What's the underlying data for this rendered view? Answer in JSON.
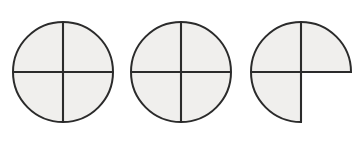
{
  "figure": {
    "background_color": "#ffffff",
    "fill_color": "#f0efed",
    "line_color": "#2b2b2b",
    "line_width": 2,
    "canvas": {
      "width": 362,
      "height": 141
    }
  },
  "chart_data": {
    "type": "pie",
    "xlabel": "",
    "ylabel": "",
    "legend": [],
    "grid": false,
    "shapes": [
      {
        "name": "circle-one",
        "label": "4/4",
        "center_x": 63,
        "center_y": 72,
        "radius": 51,
        "total_parts": 4,
        "shaded_parts": 4,
        "fraction_value": 1,
        "quadrants_shaded": [
          "top-left",
          "top-right",
          "bottom-left",
          "bottom-right"
        ]
      },
      {
        "name": "circle-two",
        "label": "4/4",
        "center_x": 181,
        "center_y": 72,
        "radius": 51,
        "total_parts": 4,
        "shaded_parts": 4,
        "fraction_value": 1,
        "quadrants_shaded": [
          "top-left",
          "top-right",
          "bottom-left",
          "bottom-right"
        ]
      },
      {
        "name": "circle-three",
        "label": "3/4",
        "center_x": 301,
        "center_y": 72,
        "radius": 51,
        "total_parts": 4,
        "shaded_parts": 3,
        "fraction_value": 0.75,
        "quadrants_shaded": [
          "top-left",
          "top-right",
          "bottom-left"
        ],
        "quadrants_empty": [
          "bottom-right"
        ]
      }
    ],
    "categories": [
      "circle-one",
      "circle-two",
      "circle-three"
    ],
    "values": [
      1,
      1,
      0.75
    ]
  }
}
